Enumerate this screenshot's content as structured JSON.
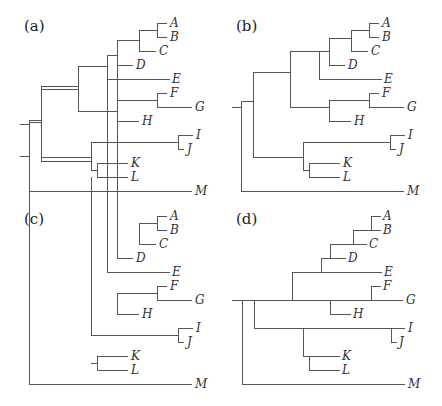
{
  "figure": {
    "line_color": "#555555",
    "text_color": "#333333",
    "panels": [
      {
        "id": "a",
        "label": "(a)",
        "style": "rectangular",
        "tree": "((((((A,B),C),D),E),((F,G),H)),((I,J),(K,L))),M"
      },
      {
        "id": "b",
        "label": "(b)",
        "style": "rectangular",
        "tree": "((((((A,B),C),D),E),((F,G),H)),((I,J),(K,L))),M"
      },
      {
        "id": "c",
        "label": "(c)",
        "style": "rectangular",
        "tree": "((((((A,B),C),D),E),((F,G),H)),((I,J),(K,L))),M"
      },
      {
        "id": "d",
        "label": "(d)",
        "style": "ladder",
        "tree": "((((((A,B),C),D),E),((F,G),H)),((I,J),(K,L))),M"
      }
    ],
    "leaves": [
      "A",
      "B",
      "C",
      "D",
      "E",
      "F",
      "G",
      "H",
      "I",
      "J",
      "K",
      "L",
      "M"
    ]
  }
}
